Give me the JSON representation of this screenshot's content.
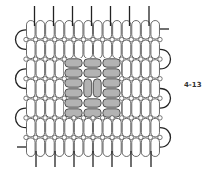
{
  "figure": {
    "label": "4-13",
    "grid": {
      "columns": 14,
      "rows": 7,
      "x0": 26,
      "y0": 20,
      "bead_width": 9.57,
      "row_height": 19.57
    },
    "gray_block": {
      "x": 64,
      "y": 58,
      "col_groups": 3,
      "row_groups": 3,
      "group_width": 19,
      "group_height": 20,
      "center_vertical": true
    },
    "colors": {
      "bead_fill": "#ffffff",
      "bead_stroke": "#444444",
      "gray_fill": "#b3b3b3",
      "thread": "#222222"
    },
    "top_threads_x": [
      34.5,
      53.5,
      72.5,
      91.5,
      110.5,
      129.5,
      149
    ],
    "bottom_threads_x": [
      36,
      55,
      74,
      93,
      112,
      131,
      151
    ],
    "left_loops_rows": [
      [
        1,
        2
      ],
      [
        3,
        4
      ],
      [
        5,
        6
      ]
    ],
    "right_loops_rows": [
      [
        2,
        3
      ],
      [
        4,
        5
      ],
      [
        6,
        7
      ]
    ]
  }
}
